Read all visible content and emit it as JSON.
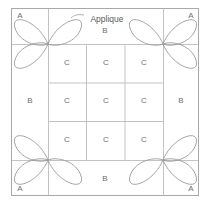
{
  "diagram": {
    "colors": {
      "background": "#ffffff",
      "grid_line": "#b9b9b9",
      "border_line": "#a8a8a8",
      "petal_line": "#9a9a9a",
      "label_text": "#6e6e6e",
      "leader_line": "#9a9a9a"
    },
    "callout": {
      "label": "Applique",
      "x": 107,
      "y": 19
    },
    "piece_labels": [
      {
        "id": "a-top-left",
        "text": "A",
        "x": 20,
        "y": 16,
        "piece": "A"
      },
      {
        "id": "a-top-right",
        "text": "A",
        "x": 191,
        "y": 16,
        "piece": "A"
      },
      {
        "id": "a-bottom-left",
        "text": "A",
        "x": 20,
        "y": 189,
        "piece": "A"
      },
      {
        "id": "a-bottom-right",
        "text": "A",
        "x": 191,
        "y": 189,
        "piece": "A"
      },
      {
        "id": "b-top",
        "text": "B",
        "x": 105,
        "y": 31,
        "piece": "B"
      },
      {
        "id": "b-left",
        "text": "B",
        "x": 30,
        "y": 101,
        "piece": "B"
      },
      {
        "id": "b-right",
        "text": "B",
        "x": 181,
        "y": 101,
        "piece": "B"
      },
      {
        "id": "b-bottom",
        "text": "B",
        "x": 105,
        "y": 179,
        "piece": "B"
      },
      {
        "id": "c-r1c1",
        "text": "C",
        "x": 67,
        "y": 63,
        "piece": "C"
      },
      {
        "id": "c-r1c2",
        "text": "C",
        "x": 106,
        "y": 63,
        "piece": "C"
      },
      {
        "id": "c-r1c3",
        "text": "C",
        "x": 144,
        "y": 63,
        "piece": "C"
      },
      {
        "id": "c-r2c1",
        "text": "C",
        "x": 67,
        "y": 101,
        "piece": "C"
      },
      {
        "id": "c-r2c2",
        "text": "C",
        "x": 106,
        "y": 101,
        "piece": "C"
      },
      {
        "id": "c-r2c3",
        "text": "C",
        "x": 144,
        "y": 101,
        "piece": "C"
      },
      {
        "id": "c-r3c1",
        "text": "C",
        "x": 67,
        "y": 140,
        "piece": "C"
      },
      {
        "id": "c-r3c2",
        "text": "C",
        "x": 106,
        "y": 140,
        "piece": "C"
      },
      {
        "id": "c-r3c3",
        "text": "C",
        "x": 144,
        "y": 140,
        "piece": "C"
      }
    ],
    "geometry": {
      "outer": {
        "left": 11,
        "top": 8,
        "right": 199,
        "bottom": 196
      },
      "grid_x": [
        48,
        86,
        125,
        163
      ],
      "grid_y": [
        44,
        83,
        121,
        160
      ],
      "flower_centers": [
        {
          "id": "flower-top-left",
          "cx": 48,
          "cy": 44,
          "petals": [
            "up-left",
            "up-right",
            "down-left"
          ]
        },
        {
          "id": "flower-top-right",
          "cx": 163,
          "cy": 44,
          "petals": [
            "up-left",
            "up-right",
            "down-right"
          ]
        },
        {
          "id": "flower-bottom-left",
          "cx": 48,
          "cy": 160,
          "petals": [
            "up-left",
            "down-left",
            "down-right"
          ]
        },
        {
          "id": "flower-bottom-right",
          "cx": 163,
          "cy": 160,
          "petals": [
            "up-right",
            "down-left",
            "down-right"
          ]
        }
      ]
    }
  }
}
